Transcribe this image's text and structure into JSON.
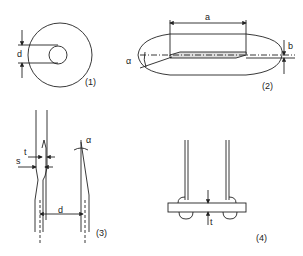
{
  "diagram": {
    "figures": [
      {
        "id": "1",
        "caption": "(1)",
        "labels": {
          "d": "d"
        }
      },
      {
        "id": "2",
        "caption": "(2)",
        "labels": {
          "a": "a",
          "b": "b",
          "alpha": "α"
        }
      },
      {
        "id": "3",
        "caption": "(3)",
        "labels": {
          "t": "t",
          "s": "s",
          "d": "d",
          "alpha": "α"
        }
      },
      {
        "id": "4",
        "caption": "(4)",
        "labels": {
          "t": "t"
        }
      }
    ],
    "colors": {
      "line": "#222222",
      "background": "#ffffff"
    }
  }
}
